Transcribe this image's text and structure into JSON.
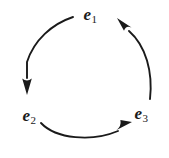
{
  "diagram": {
    "type": "cycle",
    "background_color": "#ffffff",
    "stroke_color": "#1a1a1a",
    "text_color": "#1a1a1a",
    "nodes": [
      {
        "id": "e1",
        "symbol": "e",
        "subscript": "1",
        "x": 90,
        "y": 14
      },
      {
        "id": "e2",
        "symbol": "e",
        "subscript": "2",
        "x": 29,
        "y": 115
      },
      {
        "id": "e3",
        "symbol": "e",
        "subscript": "3",
        "x": 141,
        "y": 113
      }
    ],
    "edges": [
      {
        "id": "edge-e1-e2",
        "from": "e1",
        "to": "e2",
        "direction": "counterclockwise",
        "arrowhead": "at-target"
      },
      {
        "id": "edge-e2-e3",
        "from": "e2",
        "to": "e3",
        "direction": "counterclockwise",
        "arrowhead": "at-target"
      },
      {
        "id": "edge-e3-e1",
        "from": "e3",
        "to": "e1",
        "direction": "counterclockwise",
        "arrowhead": "at-target"
      }
    ]
  }
}
